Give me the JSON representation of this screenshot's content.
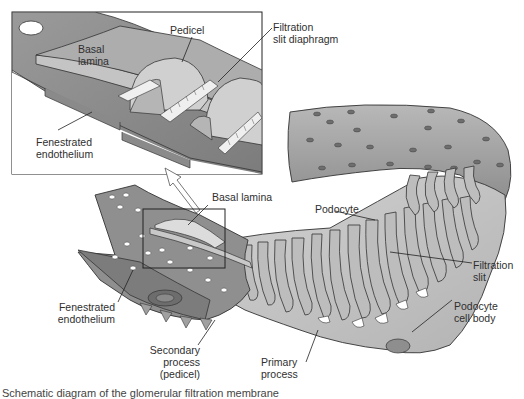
{
  "figure": {
    "type": "anatomical-illustration",
    "colors": {
      "background": "#ffffff",
      "endothelium_dark": "#8a8a8a",
      "endothelium_mid": "#a6a6a6",
      "podocyte_light": "#c9c9c9",
      "basal_lamina": "#d8d8d8",
      "outline": "#333333",
      "fenestra": "#6e6e6e"
    }
  },
  "inset": {
    "labels": {
      "pedicel": "Pedicel",
      "filtration_slit_diaphragm_1": "Filtration",
      "filtration_slit_diaphragm_2": "slit diaphragm",
      "basal_lamina_1": "Basal",
      "basal_lamina_2": "lamina",
      "fenestrated_endothelium_1": "Fenestrated",
      "fenestrated_endothelium_2": "endothelium"
    }
  },
  "main": {
    "labels": {
      "basal_lamina": "Basal lamina",
      "podocyte": "Podocyte",
      "filtration_slit_1": "Filtration",
      "filtration_slit_2": "slit",
      "fenestrated_endothelium_1": "Fenestrated",
      "fenestrated_endothelium_2": "endothelium",
      "secondary_process_1": "Secondary",
      "secondary_process_2": "process",
      "secondary_process_3": "(pedicel)",
      "primary_process_1": "Primary",
      "primary_process_2": "process",
      "podocyte_cell_body_1": "Podocyte",
      "podocyte_cell_body_2": "cell body"
    }
  },
  "caption": {
    "text_partial": "Schematic diagram of the glomerular filtration membrane"
  }
}
